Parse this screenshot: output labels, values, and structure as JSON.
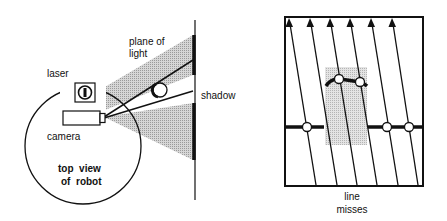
{
  "left_diagram": {
    "labels": {
      "plane_of": "plane of",
      "light": "light",
      "laser": "laser",
      "shadow": "shadow",
      "camera": "camera",
      "top_view": "top  view",
      "of_robot": "of  robot"
    }
  },
  "right_diagram": {
    "labels": {
      "line": "line",
      "misses": "misses"
    },
    "arrow_count": 6
  },
  "colors": {
    "stroke": "#111111",
    "light_fill": "#c8c8c8",
    "shadow_region": "#d9d9d9"
  }
}
